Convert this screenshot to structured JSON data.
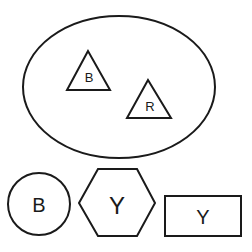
{
  "diagram": {
    "container": {
      "shape": "ellipse",
      "contents": [
        {
          "shape": "triangle",
          "label": "B"
        },
        {
          "shape": "triangle",
          "label": "R"
        }
      ]
    },
    "bottom_row": [
      {
        "shape": "circle",
        "label": "B"
      },
      {
        "shape": "hexagon",
        "label": "Y"
      },
      {
        "shape": "rectangle",
        "label": "Y"
      }
    ]
  },
  "colors": {
    "stroke": "#1a1a1a",
    "background": "#ffffff"
  }
}
